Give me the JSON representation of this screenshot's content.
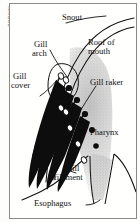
{
  "figure": {
    "credit": "GODKIN",
    "type": "anatomical-diagram",
    "background_color": "#fffffe",
    "ink_color": "#111111",
    "frame_color": "#8a8a8a",
    "stipple_color": "#b9b9b9"
  },
  "labels": {
    "snout": "Snout",
    "roof_of_mouth_line1": "Roof of",
    "roof_of_mouth_line2": "mouth",
    "gill_arch_line1": "Gill",
    "gill_arch_line2": "arch",
    "gill_cover_line1": "Gill",
    "gill_cover_line2": "cover",
    "gill_raker": "Gill raker",
    "pharynx": "Pharynx",
    "gill_filament_line1": "Gill",
    "gill_filament_line2": "filament",
    "esophagus": "Esophagus"
  },
  "structures": [
    {
      "name": "snout",
      "label": "Snout"
    },
    {
      "name": "roof-of-mouth",
      "label": "Roof of mouth"
    },
    {
      "name": "gill-arch",
      "label": "Gill arch"
    },
    {
      "name": "gill-cover",
      "label": "Gill cover"
    },
    {
      "name": "gill-raker",
      "label": "Gill raker"
    },
    {
      "name": "pharynx",
      "label": "Pharynx"
    },
    {
      "name": "gill-filament",
      "label": "Gill filament"
    },
    {
      "name": "esophagus",
      "label": "Esophagus"
    }
  ]
}
